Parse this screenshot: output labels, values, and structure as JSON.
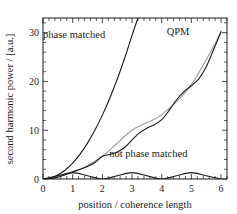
{
  "chart_data": {
    "type": "line",
    "title": "",
    "xlabel": "position / coherence length",
    "ylabel": "second harmonic power / [a.u.]",
    "xlim": [
      0,
      6.2
    ],
    "ylim": [
      0,
      33
    ],
    "xticks": [
      0,
      1,
      2,
      3,
      4,
      5,
      6
    ],
    "xtick_labels": [
      "0",
      "1",
      "2",
      "3",
      "4",
      "5",
      "6"
    ],
    "yticks": [
      0,
      10,
      20,
      30
    ],
    "ytick_labels": [
      "0",
      "10",
      "20",
      "30"
    ],
    "x_minor_step": 0.2,
    "y_minor_step": 2,
    "grid": false,
    "legend_position": "inline-annotations",
    "annotations": [
      {
        "text": "phase matched",
        "x": 1.05,
        "y": 29.0
      },
      {
        "text": "QPM",
        "x": 4.55,
        "y": 29.5
      },
      {
        "text": "not phase matched",
        "x": 3.55,
        "y": 4.6
      }
    ],
    "series": [
      {
        "name": "phase matched",
        "color": "#1a1a1a",
        "description": "quadratic growth, proportional to x squared",
        "x": [
          0,
          0.25,
          0.5,
          0.75,
          1,
          1.25,
          1.5,
          1.75,
          2,
          2.25,
          2.5,
          2.75,
          3,
          3.2
        ],
        "y": [
          0,
          0.2,
          0.82,
          1.84,
          3.27,
          5.11,
          7.36,
          10.02,
          13.09,
          16.56,
          20.45,
          24.74,
          29.45,
          33.0
        ]
      },
      {
        "name": "QPM",
        "color": "#1a1a1a",
        "description": "quasi-phase-matched staircase oscillating about the average line",
        "x": [
          0,
          0.25,
          0.5,
          0.75,
          1,
          1.25,
          1.5,
          1.75,
          2,
          2.25,
          2.5,
          2.75,
          3,
          3.25,
          3.5,
          3.75,
          4,
          4.25,
          4.5,
          4.75,
          5,
          5.25,
          5.5,
          5.75,
          6
        ],
        "y": [
          0,
          0.06,
          0.35,
          0.88,
          1.47,
          2.0,
          2.56,
          3.37,
          4.66,
          5.03,
          5.52,
          6.46,
          8.0,
          9.46,
          10.42,
          11.1,
          12.16,
          14.05,
          16.25,
          17.92,
          19.12,
          20.53,
          23.01,
          26.53,
          30.22
        ]
      },
      {
        "name": "QPM average",
        "color": "#9a9a9a",
        "description": "smooth parabolic average of the QPM curve",
        "x": [
          0,
          1,
          2,
          3,
          4,
          5,
          6
        ],
        "y": [
          0,
          1.33,
          4.66,
          10.0,
          13.2,
          19.4,
          30.1
        ]
      },
      {
        "name": "not phase matched",
        "color": "#1a1a1a",
        "description": "sin-squared oscillation with zeros at even coherence lengths",
        "x": [
          0,
          0.5,
          1,
          1.5,
          2,
          2.5,
          3,
          3.5,
          4,
          4.5,
          5,
          5.5,
          6
        ],
        "y": [
          0,
          0.65,
          1.3,
          0.65,
          0,
          0.65,
          1.3,
          0.65,
          0,
          0.65,
          1.3,
          0.65,
          0
        ]
      }
    ]
  }
}
